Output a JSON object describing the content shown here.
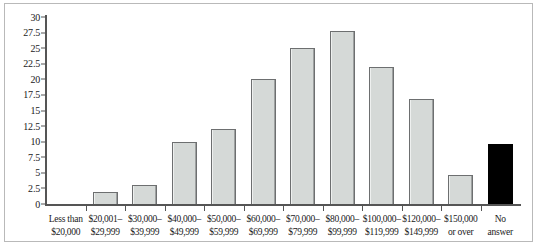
{
  "chart_data": {
    "type": "bar",
    "title": "",
    "xlabel": "",
    "ylabel": "",
    "ylim": [
      0,
      30
    ],
    "grid": false,
    "legend": false,
    "yticks": [
      "0",
      "2.5",
      "5",
      "7.5",
      "10",
      "12.5",
      "15",
      "17.5",
      "20",
      "22.5",
      "25",
      "27.5",
      "30"
    ],
    "ytick_values": [
      0,
      2.5,
      5,
      7.5,
      10,
      12.5,
      15,
      17.5,
      20,
      22.5,
      25,
      27.5,
      30
    ],
    "categories": [
      "Less than $20,000",
      "$20,001–$29,999",
      "$30,000–$39,999",
      "$40,000–$49,999",
      "$50,000–$59,999",
      "$60,000–$69,999",
      "$70,000–$79,999",
      "$80,000–$99,999",
      "$100,000–$119,999",
      "$120,000–$149,999",
      "$150,000 or over",
      "No answer"
    ],
    "category_lines": [
      [
        "Less than",
        "$20,000"
      ],
      [
        "$20,001–",
        "$29,999"
      ],
      [
        "$30,000–",
        "$39,999"
      ],
      [
        "$40,000–",
        "$49,999"
      ],
      [
        "$50,000–",
        "$59,999"
      ],
      [
        "$60,000–",
        "$69,999"
      ],
      [
        "$70,000–",
        "$79,999"
      ],
      [
        "$80,000–",
        "$99,999"
      ],
      [
        "$100,000–",
        "$119,999"
      ],
      [
        "$120,000–",
        "$149,999"
      ],
      [
        "$150,000",
        "or over"
      ],
      [
        "No",
        "answer"
      ]
    ],
    "values": [
      0,
      2,
      3,
      10,
      12,
      20,
      25,
      27.8,
      22,
      16.8,
      4.6,
      9.6
    ],
    "bar_colors": [
      "#d5d9d7",
      "#d5d9d7",
      "#d5d9d7",
      "#d5d9d7",
      "#d5d9d7",
      "#d5d9d7",
      "#d5d9d7",
      "#d5d9d7",
      "#d5d9d7",
      "#d5d9d7",
      "#d5d9d7",
      "#000000"
    ],
    "colors": {
      "bar_fill": "#d5d9d7",
      "bar_edge": "#6d6f70",
      "highlight_bar": "#000000",
      "axis": "#555555",
      "frame": "#b9b9b9",
      "background": "#ffffff",
      "text": "#1a1a1a"
    }
  }
}
